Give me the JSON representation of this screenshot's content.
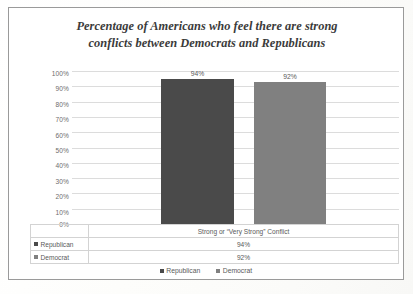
{
  "chart_data": {
    "type": "bar",
    "title": "Percentage of Americans who feel there are strong conflicts between Democrats and Republicans",
    "title_line1": "Percentage of Americans who feel there are strong",
    "title_line2": "conflicts between Democrats and Republicans",
    "categories": [
      "Strong or “Very Strong” Conflict"
    ],
    "series": [
      {
        "name": "Republican",
        "values": [
          94
        ],
        "value_labels": [
          "94%"
        ],
        "color": "#4a4a4a"
      },
      {
        "name": "Democrat",
        "values": [
          92
        ],
        "value_labels": [
          "92%"
        ],
        "color": "#808080"
      }
    ],
    "xlabel": "",
    "ylabel": "",
    "ylim": [
      0,
      100
    ],
    "y_ticks": [
      100,
      90,
      80,
      70,
      60,
      50,
      40,
      30,
      20,
      10,
      0
    ],
    "y_tick_labels": [
      "100%",
      "90%",
      "80%",
      "70%",
      "60%",
      "50%",
      "40%",
      "30%",
      "20%",
      "10%",
      "0%"
    ],
    "grid": true,
    "legend_position": "bottom",
    "data_table_visible": true,
    "units": "percent"
  },
  "table": {
    "category_header": "Strong or “Very Strong” Conflict",
    "rows": [
      {
        "label": "Republican",
        "value": "94%",
        "color": "#4a4a4a"
      },
      {
        "label": "Democrat",
        "value": "92%",
        "color": "#808080"
      }
    ]
  },
  "legend": {
    "items": [
      {
        "label": "Republican",
        "color": "#4a4a4a"
      },
      {
        "label": "Democrat",
        "color": "#808080"
      }
    ]
  },
  "colors": {
    "republican": "#4a4a4a",
    "democrat": "#808080",
    "gridline": "#dcdcdc",
    "frame": "#9a9a9a",
    "text": "#5a5a5a",
    "title_text": "#3b3b3b"
  }
}
